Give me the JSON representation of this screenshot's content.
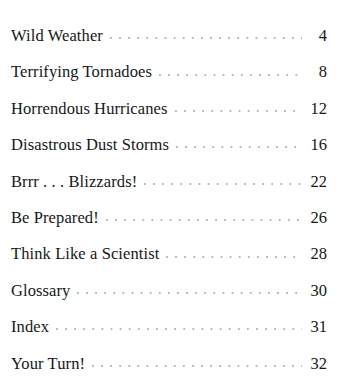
{
  "document": {
    "type": "table-of-contents",
    "background_color": "#ffffff",
    "text_color": "#171717",
    "leader_color": "#b9b9b9"
  },
  "entries": [
    {
      "title": "Wild Weather",
      "page": "4"
    },
    {
      "title": "Terrifying Tornadoes",
      "page": "8"
    },
    {
      "title": "Horrendous Hurricanes",
      "page": "12"
    },
    {
      "title": "Disastrous Dust Storms",
      "page": "16"
    },
    {
      "title": "Brrr . . . Blizzards!",
      "page": "22"
    },
    {
      "title": "Be Prepared!",
      "page": "26"
    },
    {
      "title": "Think Like a Scientist",
      "page": "28"
    },
    {
      "title": "Glossary",
      "page": "30"
    },
    {
      "title": "Index",
      "page": "31"
    },
    {
      "title": "Your Turn!",
      "page": "32"
    }
  ]
}
